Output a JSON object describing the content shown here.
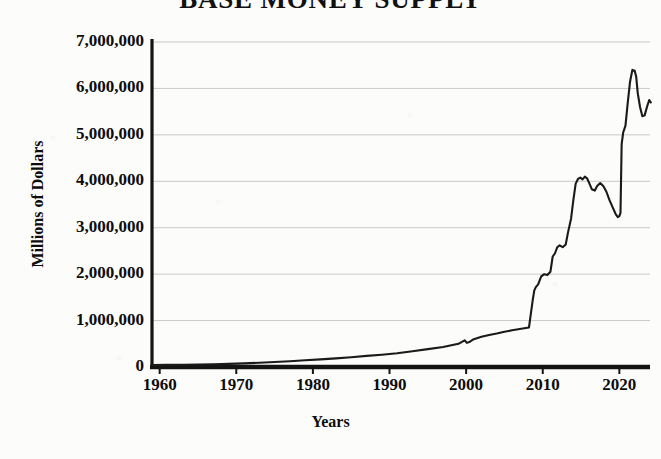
{
  "chart_data": {
    "type": "line",
    "title": "BASE MONEY SUPPLY",
    "xlabel": "Years",
    "ylabel": "Millions of Dollars",
    "xlim": [
      1959,
      2024
    ],
    "ylim": [
      0,
      7000000
    ],
    "grid": true,
    "legend": null,
    "y_ticks": [
      {
        "value": 7000000,
        "label": "7,000,000"
      },
      {
        "value": 6000000,
        "label": "6,000,000"
      },
      {
        "value": 5000000,
        "label": "5,000,000"
      },
      {
        "value": 4000000,
        "label": "4,000,000"
      },
      {
        "value": 3000000,
        "label": "3,000,000"
      },
      {
        "value": 2000000,
        "label": "2,000,000"
      },
      {
        "value": 1000000,
        "label": "1,000,000"
      },
      {
        "value": 0,
        "label": "0"
      }
    ],
    "x_ticks": [
      {
        "value": 1960,
        "label": "1960"
      },
      {
        "value": 1970,
        "label": "1970"
      },
      {
        "value": 1980,
        "label": "1980"
      },
      {
        "value": 1990,
        "label": "1990"
      },
      {
        "value": 2000,
        "label": "2000"
      },
      {
        "value": 2010,
        "label": "2010"
      },
      {
        "value": 2020,
        "label": "2020"
      }
    ],
    "series": [
      {
        "name": "Base Money Supply",
        "color": "#1a1a1a",
        "x": [
          1959,
          1961,
          1963,
          1965,
          1967,
          1969,
          1971,
          1973,
          1975,
          1977,
          1979,
          1981,
          1983,
          1985,
          1987,
          1989,
          1991,
          1993,
          1995,
          1997,
          1999,
          1999.8,
          2000.1,
          2000.5,
          2001,
          2002,
          2003,
          2004,
          2005,
          2006,
          2007,
          2008.2,
          2008.7,
          2008.9,
          2009.1,
          2009.4,
          2009.8,
          2010.2,
          2010.6,
          2011,
          2011.3,
          2011.6,
          2011.9,
          2012.2,
          2012.6,
          2013,
          2013.3,
          2013.7,
          2014,
          2014.3,
          2014.6,
          2014.9,
          2015.2,
          2015.5,
          2015.8,
          2016.1,
          2016.4,
          2016.8,
          2017.1,
          2017.5,
          2017.9,
          2018.3,
          2018.7,
          2019.1,
          2019.5,
          2019.8,
          2020.0,
          2020.15,
          2020.3,
          2020.5,
          2020.8,
          2021.1,
          2021.4,
          2021.7,
          2022.0,
          2022.2,
          2022.4,
          2022.7,
          2023.0,
          2023.3,
          2023.6,
          2023.9,
          2024.1
        ],
        "y": [
          42000,
          45000,
          48000,
          53000,
          60000,
          68000,
          78000,
          92000,
          107000,
          123000,
          145000,
          165000,
          185000,
          210000,
          240000,
          265000,
          295000,
          340000,
          385000,
          430000,
          500000,
          575000,
          520000,
          545000,
          600000,
          650000,
          690000,
          720000,
          760000,
          790000,
          820000,
          850000,
          1450000,
          1650000,
          1720000,
          1780000,
          1950000,
          2000000,
          1980000,
          2050000,
          2380000,
          2450000,
          2580000,
          2620000,
          2580000,
          2640000,
          2900000,
          3200000,
          3600000,
          3950000,
          4050000,
          4080000,
          4040000,
          4100000,
          4060000,
          3950000,
          3830000,
          3800000,
          3900000,
          3960000,
          3900000,
          3780000,
          3600000,
          3450000,
          3300000,
          3230000,
          3250000,
          3320000,
          4800000,
          5050000,
          5200000,
          5700000,
          6150000,
          6400000,
          6380000,
          6250000,
          5900000,
          5600000,
          5400000,
          5420000,
          5600000,
          5750000,
          5700000
        ]
      }
    ],
    "annotations": [
      {
        "label": "Y2K liquidity bump",
        "x": 1999.8,
        "y": 575000
      },
      {
        "label": "2008 QE vertical jump",
        "x": 2008.5,
        "y": 1500000
      },
      {
        "label": "2014 plateau",
        "x": 2014.8,
        "y": 4080000
      },
      {
        "label": "2020 COVID spike",
        "x": 2020.4,
        "y": 4800000
      },
      {
        "label": "2022 peak",
        "x": 2022.0,
        "y": 6400000
      }
    ]
  },
  "axis": {
    "spine_color": "#141414",
    "grid_color": "#c9c9c9",
    "background": "#fcfcfb"
  }
}
